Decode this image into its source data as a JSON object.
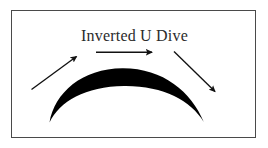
{
  "figure": {
    "title": "Inverted U Dive",
    "background_color": "#ffffff",
    "border_color": "#4a4a4a",
    "ink_color": "#000000",
    "arc": {
      "name": "inverted-u-crescent",
      "description": "thick black crescent arc, apex at top center, tapering to sharp points at both lower ends",
      "apex_label": "",
      "fill_color": "#000000"
    },
    "arrows": [
      {
        "name": "ascent-arrow",
        "direction": "up-right",
        "label": ""
      },
      {
        "name": "peak-arrow",
        "direction": "right",
        "label": ""
      },
      {
        "name": "descent-arrow",
        "direction": "down-right",
        "label": ""
      }
    ]
  }
}
